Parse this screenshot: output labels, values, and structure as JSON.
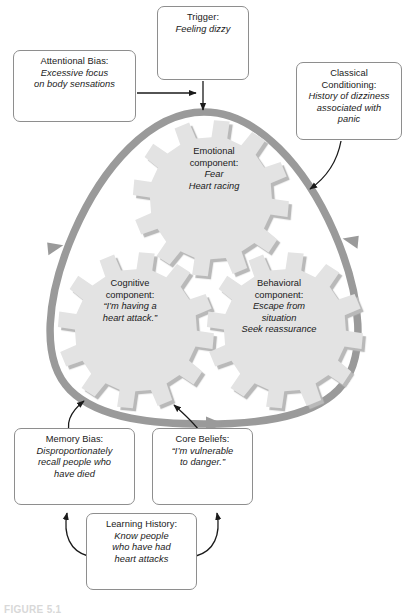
{
  "figure": {
    "caption": "FIGURE 5.1",
    "colors": {
      "cycle_loop": "#9a9a9a",
      "gear_fill": "#e3e3e3",
      "gear_shadow": "#b9b9b9",
      "box_border": "#8e8e8e",
      "connector_arrow": "#1a1a1a",
      "page_background": "#ffffff"
    }
  },
  "cycle": {
    "name": "panic-cycle",
    "gears": [
      {
        "id": "emotional",
        "title": "Emotional",
        "subtitle": "component:",
        "items": [
          "Fear",
          "Heart racing"
        ]
      },
      {
        "id": "cognitive",
        "title": "Cognitive",
        "subtitle": "component:",
        "items": [
          "“I’m having a",
          "heart attack.”"
        ]
      },
      {
        "id": "behavioral",
        "title": "Behavioral",
        "subtitle": "component:",
        "items": [
          "Escape from",
          "situation",
          "Seek reassurance"
        ]
      }
    ]
  },
  "boxes": {
    "trigger": {
      "label": "Trigger:",
      "lines": [
        "Feeling dizzy"
      ]
    },
    "attentional_bias": {
      "label": "Attentional Bias:",
      "lines": [
        "Excessive focus",
        "on body sensations"
      ]
    },
    "classical_conditioning": {
      "label_line1": "Classical",
      "label_line2": "Conditioning:",
      "lines": [
        "History of dizziness",
        "associated with",
        "panic"
      ]
    },
    "memory_bias": {
      "label": "Memory Bias:",
      "lines": [
        "Disproportionately",
        "recall people who",
        "have died"
      ]
    },
    "core_beliefs": {
      "label": "Core Beliefs:",
      "lines": [
        "“I’m vulnerable",
        "to danger.”"
      ]
    },
    "learning_history": {
      "label": "Learning History:",
      "lines": [
        "Know people",
        "who have had",
        "heart attacks"
      ]
    }
  }
}
